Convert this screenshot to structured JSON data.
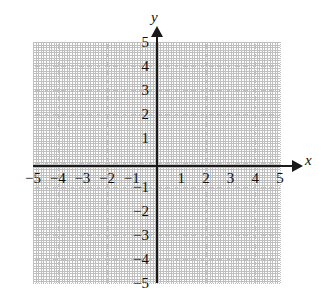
{
  "figure": {
    "kind": "cartesian-coordinate-plane",
    "background_color": "#ffffff",
    "axis_color": "#1a1a1a",
    "grid_color": "#c0c0c0"
  },
  "axes": {
    "x_label": "x",
    "y_label": "y",
    "x_arrow": "arrow-right",
    "y_arrow": "arrow-up"
  },
  "chart_data": {
    "type": "scatter",
    "title": "",
    "subtitle": "",
    "xlabel": "x",
    "ylabel": "y",
    "xlim": [
      -5,
      5
    ],
    "ylim": [
      -5,
      5
    ],
    "xticks": [
      -5,
      -4,
      -3,
      -2,
      -1,
      1,
      2,
      3,
      4,
      5
    ],
    "yticks": [
      5,
      4,
      3,
      2,
      1,
      -1,
      -2,
      -3,
      -4,
      -5
    ],
    "xtick_labels": [
      "−5",
      "−4",
      "−3",
      "−2",
      "−1",
      "1",
      "2",
      "3",
      "4",
      "5"
    ],
    "ytick_labels": [
      "5",
      "4",
      "3",
      "2",
      "1",
      "−1",
      "−2",
      "−3",
      "−4",
      "−5"
    ],
    "grid": true,
    "grid_style": "dotted",
    "grid_spacing": 1,
    "legend": null,
    "series": [],
    "annotations": [],
    "points": []
  },
  "tick_labels": {
    "x": [
      {
        "value": -5,
        "text": "−5"
      },
      {
        "value": -4,
        "text": "−4"
      },
      {
        "value": -3,
        "text": "−3"
      },
      {
        "value": -2,
        "text": "−2"
      },
      {
        "value": -1,
        "text": "−1"
      },
      {
        "value": 1,
        "text": "1"
      },
      {
        "value": 2,
        "text": "2"
      },
      {
        "value": 3,
        "text": "3"
      },
      {
        "value": 4,
        "text": "4"
      },
      {
        "value": 5,
        "text": "5"
      }
    ],
    "y": [
      {
        "value": 5,
        "text": "5"
      },
      {
        "value": 4,
        "text": "4"
      },
      {
        "value": 3,
        "text": "3"
      },
      {
        "value": 2,
        "text": "2"
      },
      {
        "value": 1,
        "text": "1"
      },
      {
        "value": -1,
        "text": "−1"
      },
      {
        "value": -2,
        "text": "−2"
      },
      {
        "value": -3,
        "text": "−3"
      },
      {
        "value": -4,
        "text": "−4"
      },
      {
        "value": -5,
        "text": "−5"
      }
    ]
  }
}
